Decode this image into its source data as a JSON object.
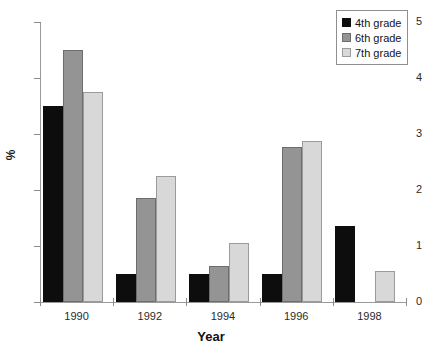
{
  "chart_data": {
    "type": "bar",
    "title": "",
    "xlabel": "Year",
    "ylabel": "%",
    "categories": [
      "1990",
      "1992",
      "1994",
      "1996",
      "1998"
    ],
    "series": [
      {
        "name": "4th grade",
        "color": "#0d0d0d",
        "values": [
          3.5,
          0.5,
          0.5,
          0.5,
          1.35
        ]
      },
      {
        "name": "6th grade",
        "color": "#949494",
        "values": [
          4.5,
          1.85,
          0.65,
          2.77,
          0
        ]
      },
      {
        "name": "7th grade",
        "color": "#d8d8d8",
        "values": [
          3.75,
          2.25,
          1.05,
          2.87,
          0.55
        ]
      }
    ],
    "ylim": [
      0,
      5
    ],
    "ytick_values": [
      0,
      1,
      2,
      3,
      4,
      5
    ],
    "ytick_labels": [
      "0",
      "1",
      "2",
      "3",
      "4",
      "5"
    ],
    "grid": false,
    "legend_position": "top-right"
  },
  "legend": {
    "entries": [
      {
        "label": "4th grade"
      },
      {
        "label": "6th grade"
      },
      {
        "label": "7th grade"
      }
    ]
  },
  "axes": {
    "y_title": "%",
    "x_title": "Year"
  }
}
